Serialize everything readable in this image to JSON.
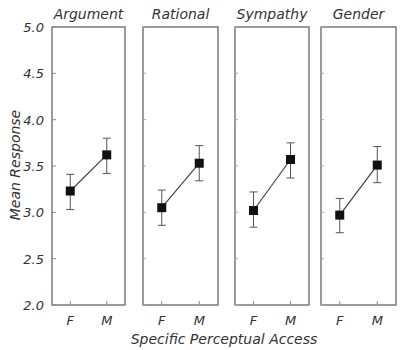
{
  "chart_data": {
    "type": "line",
    "title": "",
    "xlabel": "Specific Perceptual Access",
    "ylabel": "Mean Response",
    "ylim": [
      2.0,
      5.0
    ],
    "yticks": [
      "2.0",
      "2.5",
      "3.0",
      "3.5",
      "4.0",
      "4.5",
      "5.0"
    ],
    "categories": [
      "F",
      "M"
    ],
    "grid": false,
    "legend": "none",
    "error_bars": true,
    "panels": [
      {
        "name": "Argument",
        "values": [
          3.23,
          3.62
        ],
        "err_low": [
          3.03,
          3.42
        ],
        "err_high": [
          3.41,
          3.8
        ]
      },
      {
        "name": "Rational",
        "values": [
          3.05,
          3.53
        ],
        "err_low": [
          2.86,
          3.34
        ],
        "err_high": [
          3.24,
          3.72
        ]
      },
      {
        "name": "Sympathy",
        "values": [
          3.02,
          3.57
        ],
        "err_low": [
          2.84,
          3.37
        ],
        "err_high": [
          3.22,
          3.75
        ]
      },
      {
        "name": "Gender",
        "values": [
          2.97,
          3.51
        ],
        "err_low": [
          2.78,
          3.32
        ],
        "err_high": [
          3.15,
          3.71
        ]
      }
    ]
  }
}
